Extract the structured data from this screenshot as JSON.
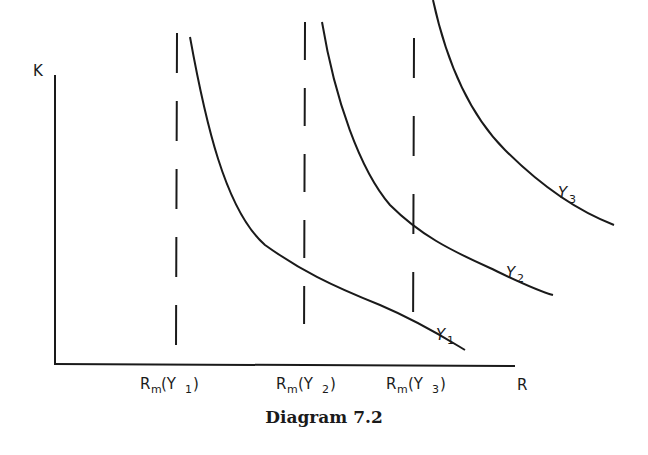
{
  "diagram": {
    "caption": "Diagram 7.2",
    "y_axis_label": "K",
    "x_axis_label": "R",
    "x_ticks": [
      {
        "main": "R",
        "sub": "m",
        "open": "(Y",
        "index": "1",
        "close": ")"
      },
      {
        "main": "R",
        "sub": "m",
        "open": "(Y",
        "index": "2",
        "close": ")"
      },
      {
        "main": "R",
        "sub": "m",
        "open": "(Y",
        "index": "3",
        "close": ")"
      }
    ],
    "curves": [
      {
        "name": "Y1",
        "label_main": "Y",
        "label_sub": "1"
      },
      {
        "name": "Y2",
        "label_main": "Y",
        "label_sub": "2"
      },
      {
        "name": "Y3",
        "label_main": "Y",
        "label_sub": "3"
      }
    ],
    "dashed_lines": [
      "R_m(Y1)",
      "R_m(Y2)",
      "R_m(Y3)"
    ],
    "stroke_color": "#1a1a1a",
    "background": "#ffffff"
  }
}
